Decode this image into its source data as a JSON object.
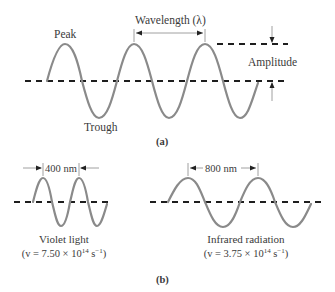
{
  "panel_a": {
    "caption": "(a)",
    "labels": {
      "peak": "Peak",
      "trough": "Trough",
      "wavelength": "Wavelength (λ)",
      "amplitude": "Amplitude"
    }
  },
  "panel_b": {
    "caption": "(b)",
    "violet": {
      "wavelength_label": "400 nm",
      "name": "Violet light",
      "freq_prefix": "(v = 7.50 × 10",
      "freq_exp": "14",
      "freq_unit": " s",
      "freq_unit_exp": "−1",
      "freq_close": ")"
    },
    "infrared": {
      "wavelength_label": "800 nm",
      "name": "Infrared radiation",
      "freq_prefix": "(v = 3.75 × 10",
      "freq_exp": "14",
      "freq_unit": " s",
      "freq_unit_exp": "−1",
      "freq_close": ")"
    }
  }
}
